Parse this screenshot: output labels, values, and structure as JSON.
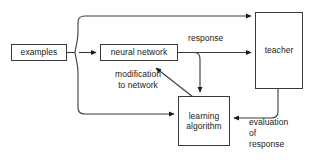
{
  "diagram": {
    "background_color": "#ffffff",
    "stroke_color": "#3a3a3a",
    "text_color": "#1a1a1a",
    "nodes": {
      "examples": "examples",
      "neural_network": "neural network",
      "teacher": "teacher",
      "learning_algorithm": "learning\nalgorithm"
    },
    "edge_labels": {
      "response": "response",
      "modification": "modification\nto network",
      "evaluation": "evaluation\nof\nresponse"
    }
  }
}
